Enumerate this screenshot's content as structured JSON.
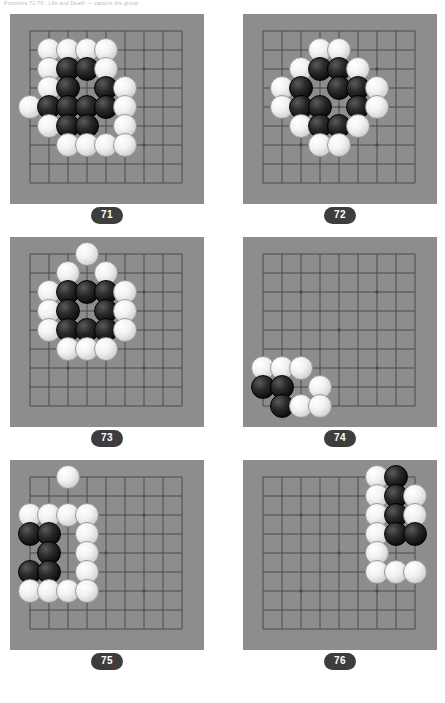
{
  "header": {
    "text": "Problems 71-76 : Life and Death — capture the group"
  },
  "colors": {
    "board_bg": "#8d8d8d",
    "grid_line": "#4b4b4b",
    "stone_black": "#111111",
    "stone_white": "#f2f2f2",
    "badge_bg": "#3d3d3d",
    "badge_text": "#ffffff",
    "page_bg": "#ffffff"
  },
  "board_spec": {
    "grid_size": 9,
    "cell_px": 19,
    "origin_x": 20,
    "origin_y": 17,
    "star_points": [
      [
        2,
        2
      ],
      [
        6,
        2
      ],
      [
        4,
        4
      ],
      [
        2,
        6
      ],
      [
        6,
        6
      ]
    ]
  },
  "problems": [
    {
      "number": "71",
      "label": "problem-71",
      "stones": [
        {
          "c": "w",
          "x": 1,
          "y": 1
        },
        {
          "c": "w",
          "x": 2,
          "y": 1
        },
        {
          "c": "w",
          "x": 3,
          "y": 1
        },
        {
          "c": "w",
          "x": 4,
          "y": 1
        },
        {
          "c": "w",
          "x": 1,
          "y": 2
        },
        {
          "c": "b",
          "x": 2,
          "y": 2
        },
        {
          "c": "b",
          "x": 3,
          "y": 2
        },
        {
          "c": "w",
          "x": 4,
          "y": 2
        },
        {
          "c": "w",
          "x": 1,
          "y": 3
        },
        {
          "c": "b",
          "x": 2,
          "y": 3
        },
        {
          "c": "b",
          "x": 4,
          "y": 3
        },
        {
          "c": "w",
          "x": 5,
          "y": 3
        },
        {
          "c": "w",
          "x": 0,
          "y": 4
        },
        {
          "c": "b",
          "x": 1,
          "y": 4
        },
        {
          "c": "b",
          "x": 2,
          "y": 4
        },
        {
          "c": "b",
          "x": 3,
          "y": 4
        },
        {
          "c": "b",
          "x": 4,
          "y": 4
        },
        {
          "c": "w",
          "x": 5,
          "y": 4
        },
        {
          "c": "w",
          "x": 1,
          "y": 5
        },
        {
          "c": "b",
          "x": 2,
          "y": 5
        },
        {
          "c": "b",
          "x": 3,
          "y": 5
        },
        {
          "c": "w",
          "x": 5,
          "y": 5
        },
        {
          "c": "w",
          "x": 2,
          "y": 6
        },
        {
          "c": "w",
          "x": 3,
          "y": 6
        },
        {
          "c": "w",
          "x": 4,
          "y": 6
        },
        {
          "c": "w",
          "x": 5,
          "y": 6
        }
      ]
    },
    {
      "number": "72",
      "label": "problem-72",
      "stones": [
        {
          "c": "w",
          "x": 3,
          "y": 1
        },
        {
          "c": "w",
          "x": 4,
          "y": 1
        },
        {
          "c": "w",
          "x": 2,
          "y": 2
        },
        {
          "c": "b",
          "x": 3,
          "y": 2
        },
        {
          "c": "b",
          "x": 4,
          "y": 2
        },
        {
          "c": "w",
          "x": 5,
          "y": 2
        },
        {
          "c": "w",
          "x": 1,
          "y": 3
        },
        {
          "c": "b",
          "x": 2,
          "y": 3
        },
        {
          "c": "b",
          "x": 4,
          "y": 3
        },
        {
          "c": "b",
          "x": 5,
          "y": 3
        },
        {
          "c": "w",
          "x": 6,
          "y": 3
        },
        {
          "c": "w",
          "x": 1,
          "y": 4
        },
        {
          "c": "b",
          "x": 2,
          "y": 4
        },
        {
          "c": "b",
          "x": 3,
          "y": 4
        },
        {
          "c": "b",
          "x": 5,
          "y": 4
        },
        {
          "c": "w",
          "x": 6,
          "y": 4
        },
        {
          "c": "w",
          "x": 2,
          "y": 5
        },
        {
          "c": "b",
          "x": 3,
          "y": 5
        },
        {
          "c": "b",
          "x": 4,
          "y": 5
        },
        {
          "c": "w",
          "x": 5,
          "y": 5
        },
        {
          "c": "w",
          "x": 3,
          "y": 6
        },
        {
          "c": "w",
          "x": 4,
          "y": 6
        }
      ]
    },
    {
      "number": "73",
      "label": "problem-73",
      "stones": [
        {
          "c": "w",
          "x": 3,
          "y": 0
        },
        {
          "c": "w",
          "x": 2,
          "y": 1
        },
        {
          "c": "w",
          "x": 4,
          "y": 1
        },
        {
          "c": "w",
          "x": 1,
          "y": 2
        },
        {
          "c": "b",
          "x": 2,
          "y": 2
        },
        {
          "c": "b",
          "x": 3,
          "y": 2
        },
        {
          "c": "b",
          "x": 4,
          "y": 2
        },
        {
          "c": "w",
          "x": 5,
          "y": 2
        },
        {
          "c": "w",
          "x": 1,
          "y": 3
        },
        {
          "c": "b",
          "x": 2,
          "y": 3
        },
        {
          "c": "b",
          "x": 4,
          "y": 3
        },
        {
          "c": "w",
          "x": 5,
          "y": 3
        },
        {
          "c": "w",
          "x": 1,
          "y": 4
        },
        {
          "c": "b",
          "x": 2,
          "y": 4
        },
        {
          "c": "b",
          "x": 3,
          "y": 4
        },
        {
          "c": "b",
          "x": 4,
          "y": 4
        },
        {
          "c": "w",
          "x": 5,
          "y": 4
        },
        {
          "c": "w",
          "x": 2,
          "y": 5
        },
        {
          "c": "w",
          "x": 3,
          "y": 5
        },
        {
          "c": "w",
          "x": 4,
          "y": 5
        }
      ]
    },
    {
      "number": "74",
      "label": "problem-74",
      "stones": [
        {
          "c": "w",
          "x": 0,
          "y": 6
        },
        {
          "c": "w",
          "x": 1,
          "y": 6
        },
        {
          "c": "w",
          "x": 2,
          "y": 6
        },
        {
          "c": "b",
          "x": 0,
          "y": 7
        },
        {
          "c": "b",
          "x": 1,
          "y": 7
        },
        {
          "c": "w",
          "x": 3,
          "y": 7
        },
        {
          "c": "b",
          "x": 1,
          "y": 8
        },
        {
          "c": "w",
          "x": 2,
          "y": 8
        },
        {
          "c": "w",
          "x": 3,
          "y": 8
        }
      ]
    },
    {
      "number": "75",
      "label": "problem-75",
      "stones": [
        {
          "c": "w",
          "x": 2,
          "y": 0
        },
        {
          "c": "w",
          "x": 0,
          "y": 2
        },
        {
          "c": "w",
          "x": 1,
          "y": 2
        },
        {
          "c": "w",
          "x": 2,
          "y": 2
        },
        {
          "c": "w",
          "x": 3,
          "y": 2
        },
        {
          "c": "b",
          "x": 0,
          "y": 3
        },
        {
          "c": "b",
          "x": 1,
          "y": 3
        },
        {
          "c": "w",
          "x": 3,
          "y": 3
        },
        {
          "c": "b",
          "x": 1,
          "y": 4
        },
        {
          "c": "w",
          "x": 3,
          "y": 4
        },
        {
          "c": "b",
          "x": 0,
          "y": 5
        },
        {
          "c": "b",
          "x": 1,
          "y": 5
        },
        {
          "c": "w",
          "x": 3,
          "y": 5
        },
        {
          "c": "w",
          "x": 0,
          "y": 6
        },
        {
          "c": "w",
          "x": 1,
          "y": 6
        },
        {
          "c": "w",
          "x": 2,
          "y": 6
        },
        {
          "c": "w",
          "x": 3,
          "y": 6
        }
      ]
    },
    {
      "number": "76",
      "label": "problem-76",
      "stones": [
        {
          "c": "w",
          "x": 6,
          "y": 0
        },
        {
          "c": "b",
          "x": 7,
          "y": 0
        },
        {
          "c": "w",
          "x": 6,
          "y": 1
        },
        {
          "c": "b",
          "x": 7,
          "y": 1
        },
        {
          "c": "w",
          "x": 8,
          "y": 1
        },
        {
          "c": "w",
          "x": 6,
          "y": 2
        },
        {
          "c": "b",
          "x": 7,
          "y": 2
        },
        {
          "c": "w",
          "x": 8,
          "y": 2
        },
        {
          "c": "w",
          "x": 6,
          "y": 3
        },
        {
          "c": "b",
          "x": 7,
          "y": 3
        },
        {
          "c": "b",
          "x": 8,
          "y": 3
        },
        {
          "c": "w",
          "x": 6,
          "y": 4
        },
        {
          "c": "w",
          "x": 6,
          "y": 5
        },
        {
          "c": "w",
          "x": 7,
          "y": 5
        },
        {
          "c": "w",
          "x": 8,
          "y": 5
        }
      ]
    }
  ]
}
